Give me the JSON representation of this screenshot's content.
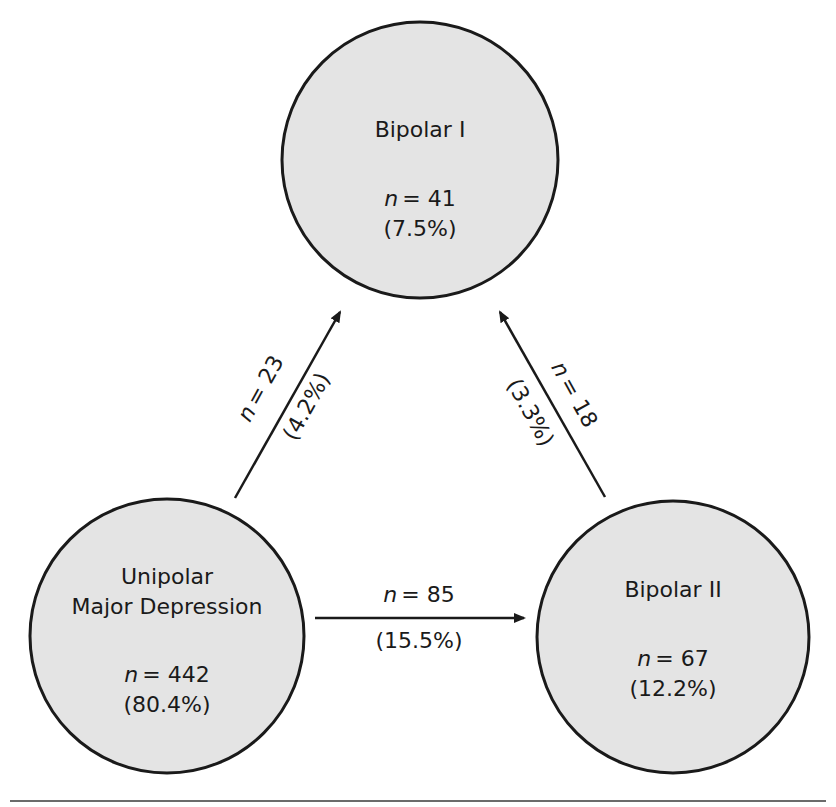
{
  "diagram": {
    "nodes": [
      {
        "id": "bipolar1",
        "name_lines": [
          "Bipolar I"
        ],
        "n_prefix": "n",
        "n_value": "= 41",
        "pct": "(7.5%)"
      },
      {
        "id": "unipolar",
        "name_lines": [
          "Unipolar",
          "Major Depression"
        ],
        "n_prefix": "n",
        "n_value": "= 442",
        "pct": "(80.4%)"
      },
      {
        "id": "bipolar2",
        "name_lines": [
          "Bipolar II"
        ],
        "n_prefix": "n",
        "n_value": "= 67",
        "pct": "(12.2%)"
      }
    ],
    "edges": [
      {
        "from": "unipolar",
        "to": "bipolar1",
        "n_prefix": "n",
        "n_value": "= 23",
        "pct": "(4.2%)"
      },
      {
        "from": "bipolar2",
        "to": "bipolar1",
        "n_prefix": "n",
        "n_value": "= 18",
        "pct": "(3.3%)"
      },
      {
        "from": "unipolar",
        "to": "bipolar2",
        "n_prefix": "n",
        "n_value": "= 85",
        "pct": "(15.5%)"
      }
    ],
    "colors": {
      "node_fill": "#e4e4e4",
      "stroke": "#1a1a1a",
      "background": "#ffffff"
    }
  }
}
